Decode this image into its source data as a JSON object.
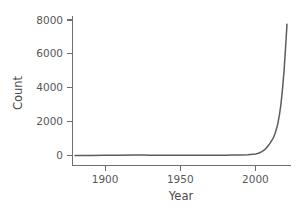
{
  "chart_data": {
    "type": "line",
    "title": "",
    "xlabel": "Year",
    "ylabel": "Count",
    "xlim": [
      1878,
      2023
    ],
    "ylim": [
      -300,
      8300
    ],
    "xticks": [
      1900,
      1950,
      2000
    ],
    "xticklabels": [
      "1900",
      "1950",
      "2000"
    ],
    "yticks": [
      0,
      2000,
      4000,
      6000,
      8000
    ],
    "yticklabels": [
      "0",
      "2000",
      "4000",
      "6000",
      "8000"
    ],
    "grid": false,
    "legend": "none",
    "series": [
      {
        "name": "Count",
        "color": "#5c5c5c",
        "x": [
          1880,
          1890,
          1900,
          1910,
          1920,
          1925,
          1930,
          1940,
          1950,
          1960,
          1970,
          1980,
          1985,
          1990,
          1995,
          2000,
          2002,
          2004,
          2006,
          2008,
          2010,
          2011,
          2012,
          2013,
          2014,
          2015,
          2016,
          2017,
          2018,
          2019,
          2020,
          2021
        ],
        "values": [
          5,
          6,
          8,
          10,
          25,
          30,
          22,
          15,
          14,
          16,
          18,
          20,
          24,
          30,
          45,
          90,
          130,
          210,
          330,
          520,
          760,
          905,
          1060,
          1280,
          1560,
          1930,
          2420,
          3050,
          3900,
          4950,
          6300,
          7750
        ]
      }
    ]
  },
  "axes": {
    "y_title": "Count",
    "x_title": "Year"
  },
  "colors": {
    "line": "#5c5c5c",
    "spine": "#6e6e6e",
    "tick_text": "#575757",
    "background": "#ffffff"
  }
}
